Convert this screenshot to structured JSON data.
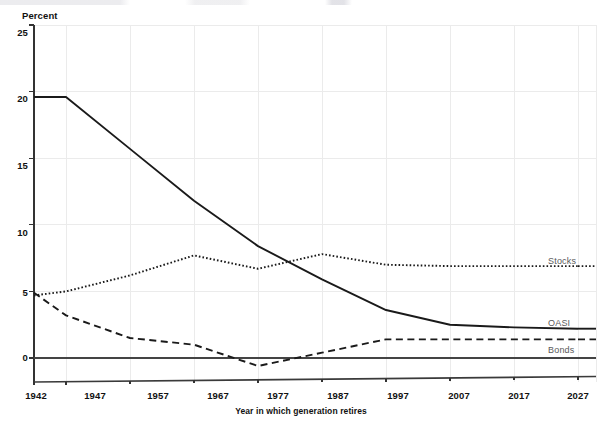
{
  "chart_data": {
    "type": "line",
    "title": "",
    "subtitle": "",
    "xlabel": "Year in which generation retires",
    "ylabel": "Percent",
    "x": [
      1942,
      1947,
      1957,
      1967,
      1977,
      1987,
      1997,
      2007,
      2017,
      2027
    ],
    "categories": [
      "1942",
      "1947",
      "1957",
      "1967",
      "1977",
      "1987",
      "1997",
      "2007",
      "2017",
      "2027"
    ],
    "xlim": [
      1942,
      2027
    ],
    "ylim": [
      0,
      25
    ],
    "ylim_drawn": [
      -1.8,
      25
    ],
    "yticks": [
      0,
      5,
      10,
      15,
      20,
      25
    ],
    "ytick_labels": [
      "0",
      "5",
      "10",
      "15",
      "20",
      "25"
    ],
    "xticks": [
      1942,
      1947,
      1957,
      1967,
      1977,
      1987,
      1997,
      2007,
      2017,
      2027
    ],
    "grid": true,
    "grid_color": "#ebebeb",
    "legend_position": "right-inline",
    "series": [
      {
        "name": "OASI",
        "style": "solid",
        "color": "#1a1a1a",
        "values": [
          19.6,
          19.6,
          15.7,
          11.8,
          8.4,
          5.9,
          3.6,
          2.5,
          2.3,
          2.2
        ]
      },
      {
        "name": "Stocks",
        "style": "dotted",
        "color": "#1a1a1a",
        "values": [
          4.7,
          5.0,
          6.2,
          7.7,
          6.7,
          7.8,
          7.0,
          6.9,
          6.9,
          6.9
        ]
      },
      {
        "name": "Bonds",
        "style": "dashed",
        "color": "#1a1a1a",
        "values": [
          4.9,
          3.2,
          1.5,
          1.0,
          -0.6,
          0.4,
          1.4,
          1.4,
          1.4,
          1.4
        ]
      }
    ],
    "annotations": [
      {
        "text": "Stocks",
        "x": 2019,
        "y": 7.45
      },
      {
        "text": "OASI",
        "x": 2019,
        "y": 2.85
      },
      {
        "text": "Bonds",
        "x": 2019,
        "y": 0.75
      }
    ]
  },
  "axes": {
    "y_title": "Percent",
    "x_title": "Year in which generation retires",
    "ytick_labels": [
      "25",
      "20",
      "15",
      "10",
      "5",
      "0"
    ],
    "xtick_labels": [
      "1942",
      "1947",
      "1957",
      "1967",
      "1977",
      "1987",
      "1997",
      "2007",
      "2017",
      "2027"
    ]
  },
  "legend": {
    "stocks": "Stocks",
    "oasi": "OASI",
    "bonds": "Bonds"
  }
}
